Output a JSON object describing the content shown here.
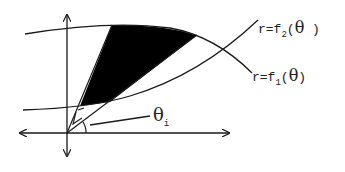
{
  "diagram": {
    "type": "polar-region-between-curves",
    "labels": {
      "curve2": {
        "prefix": "r=f",
        "subscript": "2",
        "open": "(",
        "var": "θ",
        "close": " )"
      },
      "curve1": {
        "prefix": "r=f",
        "subscript": "1",
        "open": "(",
        "var": "θ",
        "close": ")"
      },
      "angle": {
        "symbol": "θ",
        "subscript": "i"
      }
    },
    "colors": {
      "stroke": "#1a1a1a",
      "fill": "#000000",
      "background": "#ffffff"
    }
  }
}
